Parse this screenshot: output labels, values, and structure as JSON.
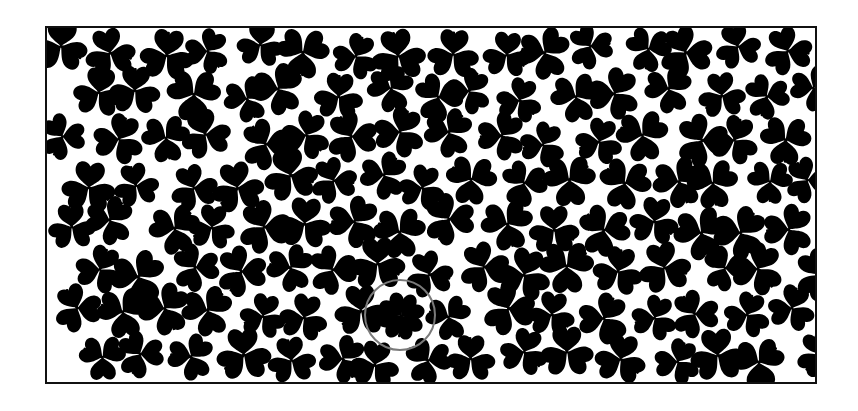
{
  "puzzle": {
    "title": "",
    "type": "find-the-four-leaf-clover",
    "colors": {
      "background": "#ffffff",
      "clover": "#000000",
      "frame": "#111111",
      "highlight_circle": "#7a7a7a"
    },
    "frame": {
      "x": 46,
      "y": 27,
      "width": 770,
      "height": 356,
      "stroke_width": 2
    },
    "clover_icon": "three-leaf-clover-icon",
    "target_icon": "four-leaf-clover-icon",
    "target": {
      "cx": 401,
      "cy": 316,
      "leaf_count": 4,
      "rotation": 8
    },
    "highlight": {
      "cx": 400,
      "cy": 315,
      "r": 35,
      "stroke_width": 2
    },
    "grid": {
      "cols": 16,
      "rows": 8,
      "cell_w": 48,
      "cell_h": 44,
      "origin_x": 70,
      "origin_y": 50,
      "seed": 17
    }
  }
}
